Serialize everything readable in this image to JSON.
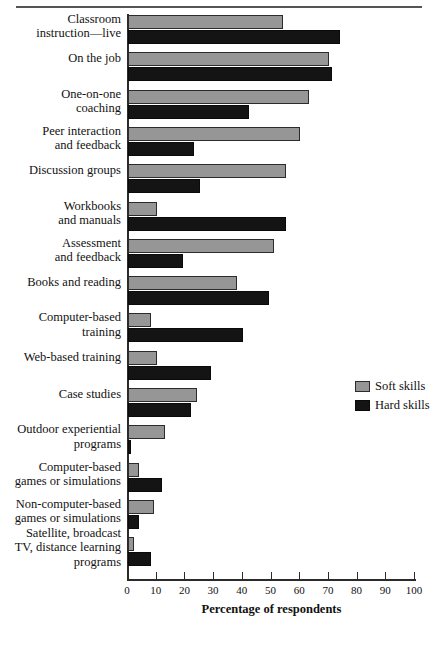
{
  "chart_data": {
    "type": "bar",
    "orientation": "horizontal",
    "title": "",
    "xlabel": "Percentage of respondents",
    "ylabel": "",
    "xlim": [
      0,
      100
    ],
    "xticks": [
      0,
      10,
      20,
      30,
      40,
      50,
      60,
      70,
      80,
      90,
      100
    ],
    "grid": false,
    "legend_position": "right-middle",
    "categories": [
      "Classroom instruction—live",
      "On the job",
      "One-on-one coaching",
      "Peer interaction and feedback",
      "Discussion groups",
      "Workbooks and manuals",
      "Assessment and feedback",
      "Books and reading",
      "Computer-based training",
      "Web-based training",
      "Case studies",
      "Outdoor experiential programs",
      "Computer-based games or simulations",
      "Non-computer-based games or simulations",
      "Satellite, broadcast TV, distance learning programs"
    ],
    "category_lines": [
      [
        "Classroom",
        "instruction—live"
      ],
      [
        "On the job"
      ],
      [
        "One-on-one",
        "coaching"
      ],
      [
        "Peer interaction",
        "and feedback"
      ],
      [
        "Discussion groups"
      ],
      [
        "Workbooks",
        "and manuals"
      ],
      [
        "Assessment",
        "and feedback"
      ],
      [
        "Books and reading"
      ],
      [
        "Computer-based",
        "training"
      ],
      [
        "Web-based training"
      ],
      [
        "Case studies"
      ],
      [
        "Outdoor experiential",
        "programs"
      ],
      [
        "Computer-based",
        "games or simulations"
      ],
      [
        "Non-computer-based",
        "games or simulations"
      ],
      [
        "Satellite, broadcast",
        "TV, distance learning",
        "programs"
      ]
    ],
    "series": [
      {
        "name": "Soft skills",
        "color": "#969696",
        "values": [
          54,
          70,
          63,
          60,
          55,
          10,
          51,
          38,
          8,
          10,
          24,
          13,
          4,
          9,
          2
        ]
      },
      {
        "name": "Hard skills",
        "color": "#141414",
        "values": [
          74,
          71,
          42,
          23,
          25,
          55,
          19,
          49,
          40,
          29,
          22,
          1,
          12,
          4,
          8
        ]
      }
    ]
  },
  "legend": {
    "items": [
      {
        "label": "Soft skills",
        "color": "#969696"
      },
      {
        "label": "Hard skills",
        "color": "#141414"
      }
    ]
  },
  "axis": {
    "x_title": "Percentage of respondents",
    "x_tick_labels": [
      "0",
      "10",
      "20",
      "30",
      "40",
      "50",
      "60",
      "70",
      "80",
      "90",
      "100"
    ]
  },
  "colors": {
    "soft_skills": "#969696",
    "hard_skills": "#141414",
    "axis": "#2b2b2b",
    "background": "#ffffff",
    "text": "#111111"
  }
}
